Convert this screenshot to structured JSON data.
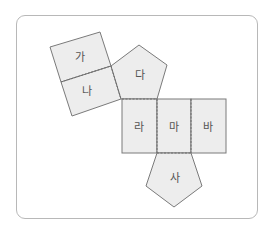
{
  "diagram": {
    "type": "polyhedron-net",
    "colors": {
      "face_fill": "#ededed",
      "face_stroke": "#7a7a7a",
      "frame_stroke": "#b8b8b8"
    },
    "faces": [
      {
        "id": "ga",
        "label": "가",
        "shape": "square"
      },
      {
        "id": "na",
        "label": "나",
        "shape": "square"
      },
      {
        "id": "da",
        "label": "다",
        "shape": "pentagon"
      },
      {
        "id": "ra",
        "label": "라",
        "shape": "rectangle"
      },
      {
        "id": "ma",
        "label": "마",
        "shape": "rectangle"
      },
      {
        "id": "ba",
        "label": "바",
        "shape": "rectangle"
      },
      {
        "id": "sa",
        "label": "사",
        "shape": "pentagon"
      }
    ]
  }
}
